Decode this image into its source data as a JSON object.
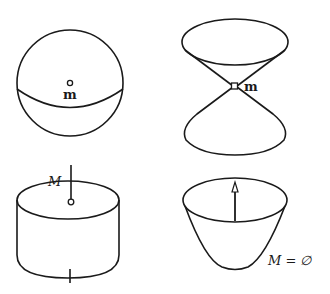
{
  "figures": [
    {
      "name": "sphere",
      "label": "m",
      "marker": "open-circle"
    },
    {
      "name": "double-cone",
      "label": "m",
      "marker": "open-square-apex"
    },
    {
      "name": "cylinder",
      "label": "M",
      "marker": "open-circle-on-rod"
    },
    {
      "name": "paraboloid",
      "label": "M = ∅",
      "marker": "arrow-up"
    }
  ],
  "colors": {
    "stroke": "#1a1a1a",
    "background": "#ffffff"
  }
}
